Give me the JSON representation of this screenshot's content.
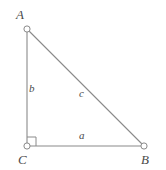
{
  "figure": {
    "type": "right-triangle-geometry-diagram",
    "background_color": "#ffffff",
    "stroke_color": "#8a8a8a",
    "label_color": "#4a4a4a",
    "vertex_marker": "open-circle"
  },
  "vertices": [
    {
      "name": "A",
      "label": "A",
      "x": 27,
      "y": 29
    },
    {
      "name": "B",
      "label": "B",
      "x": 144,
      "y": 146
    },
    {
      "name": "C",
      "label": "C",
      "x": 27,
      "y": 146
    }
  ],
  "sides": [
    {
      "name": "a",
      "label": "a",
      "from": "C",
      "to": "B",
      "role": "base-leg"
    },
    {
      "name": "b",
      "label": "b",
      "from": "C",
      "to": "A",
      "role": "vertical-leg"
    },
    {
      "name": "c",
      "label": "c",
      "from": "A",
      "to": "B",
      "role": "hypotenuse"
    }
  ],
  "angle_markers": [
    {
      "at": "C",
      "type": "right-angle-square",
      "size": 9
    }
  ]
}
